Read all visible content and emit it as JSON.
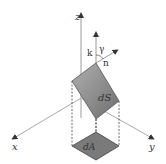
{
  "diagram": {
    "type": "surface-projection-3d",
    "labels": {
      "z_axis": "z",
      "x_axis": "x",
      "y_axis": "y",
      "k_vector": "k",
      "n_vector": "n",
      "angle": "γ",
      "surface_element": "dS",
      "area_element": "dA"
    },
    "colors": {
      "axis": "#9a9a9a",
      "surface_fill": "#8c8c8c",
      "area_fill": "#7a7a7a",
      "dash": "#444444",
      "text": "#333333"
    }
  }
}
